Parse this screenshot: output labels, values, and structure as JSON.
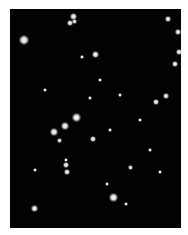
{
  "image": {
    "subject": "star field",
    "background_color": "#020202",
    "frame": {
      "x": 10,
      "y": 9,
      "width": 171,
      "height": 219
    },
    "stars": [
      {
        "x": 24,
        "y": 40,
        "r": 4
      },
      {
        "x": 73,
        "y": 16,
        "r": 2.5
      },
      {
        "x": 70,
        "y": 23,
        "r": 2
      },
      {
        "x": 74,
        "y": 21,
        "r": 1.5
      },
      {
        "x": 95,
        "y": 54,
        "r": 2.5
      },
      {
        "x": 82,
        "y": 57,
        "r": 1.2
      },
      {
        "x": 168,
        "y": 19,
        "r": 2
      },
      {
        "x": 178,
        "y": 32,
        "r": 2
      },
      {
        "x": 179,
        "y": 52,
        "r": 2
      },
      {
        "x": 175,
        "y": 64,
        "r": 2
      },
      {
        "x": 166,
        "y": 96,
        "r": 2
      },
      {
        "x": 156,
        "y": 102,
        "r": 2
      },
      {
        "x": 76,
        "y": 117,
        "r": 3.5
      },
      {
        "x": 65,
        "y": 126,
        "r": 3
      },
      {
        "x": 54,
        "y": 132,
        "r": 3
      },
      {
        "x": 59,
        "y": 140,
        "r": 1.5
      },
      {
        "x": 93,
        "y": 139,
        "r": 2
      },
      {
        "x": 66,
        "y": 160,
        "r": 1.3
      },
      {
        "x": 66,
        "y": 165,
        "r": 2
      },
      {
        "x": 67,
        "y": 172,
        "r": 2
      },
      {
        "x": 130,
        "y": 167,
        "r": 1.5
      },
      {
        "x": 160,
        "y": 172,
        "r": 1.2
      },
      {
        "x": 107,
        "y": 184,
        "r": 1.3
      },
      {
        "x": 113,
        "y": 197,
        "r": 3.5
      },
      {
        "x": 126,
        "y": 204,
        "r": 1.2
      },
      {
        "x": 34,
        "y": 208,
        "r": 2.5
      },
      {
        "x": 100,
        "y": 80,
        "r": 1
      },
      {
        "x": 120,
        "y": 95,
        "r": 1
      },
      {
        "x": 90,
        "y": 98,
        "r": 1
      },
      {
        "x": 140,
        "y": 120,
        "r": 1
      },
      {
        "x": 45,
        "y": 90,
        "r": 1
      },
      {
        "x": 110,
        "y": 130,
        "r": 1
      },
      {
        "x": 150,
        "y": 150,
        "r": 1
      },
      {
        "x": 35,
        "y": 170,
        "r": 1
      }
    ]
  }
}
